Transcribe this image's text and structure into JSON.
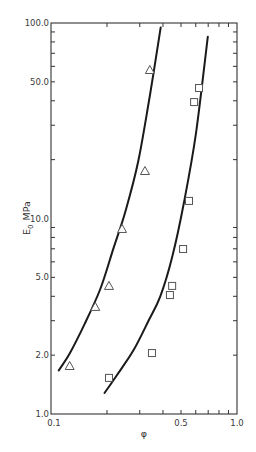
{
  "chart_data": {
    "type": "scatter",
    "title": "",
    "xlabel": "φ",
    "ylabel": "E0 MPa",
    "ylabel_main": "E",
    "ylabel_sub": "0",
    "ylabel_unit": "MPa",
    "xscale": "log",
    "yscale": "log",
    "xlim": [
      0.1,
      1.0
    ],
    "ylim": [
      1.0,
      100.0
    ],
    "grid": false,
    "legend": null,
    "x_tick_labels": [
      {
        "value": 0.1,
        "label": "0.1"
      },
      {
        "value": 0.5,
        "label": "0.5"
      },
      {
        "value": 1.0,
        "label": "1.0"
      }
    ],
    "x_minor_ticks": [
      0.2,
      0.3,
      0.4,
      0.5,
      0.6,
      0.7,
      0.8,
      0.9
    ],
    "y_tick_labels": [
      {
        "value": 1.0,
        "label": "1.0"
      },
      {
        "value": 2.0,
        "label": "2.0"
      },
      {
        "value": 5.0,
        "label": "5.0"
      },
      {
        "value": 10.0,
        "label": "10.0"
      },
      {
        "value": 50.0,
        "label": "50.0"
      },
      {
        "value": 100.0,
        "label": "100.0"
      }
    ],
    "y_minor_ticks": [
      2,
      3,
      4,
      5,
      6,
      7,
      8,
      9,
      20,
      30,
      40,
      50,
      60,
      70,
      80,
      90
    ],
    "series": [
      {
        "name": "triangles",
        "marker": "triangle-open",
        "points": [
          {
            "x": 0.126,
            "y": 1.76
          },
          {
            "x": 0.173,
            "y": 3.53
          },
          {
            "x": 0.205,
            "y": 4.52
          },
          {
            "x": 0.241,
            "y": 8.84
          },
          {
            "x": 0.32,
            "y": 17.5
          },
          {
            "x": 0.34,
            "y": 57.5
          }
        ],
        "fit_curve": [
          {
            "x": 0.11,
            "y": 1.67
          },
          {
            "x": 0.126,
            "y": 2.04
          },
          {
            "x": 0.152,
            "y": 2.9
          },
          {
            "x": 0.184,
            "y": 4.36
          },
          {
            "x": 0.216,
            "y": 6.97
          },
          {
            "x": 0.252,
            "y": 11.0
          },
          {
            "x": 0.295,
            "y": 19.8
          },
          {
            "x": 0.34,
            "y": 42.6
          },
          {
            "x": 0.389,
            "y": 95.0
          }
        ]
      },
      {
        "name": "squares",
        "marker": "square-open",
        "points": [
          {
            "x": 0.205,
            "y": 1.53
          },
          {
            "x": 0.349,
            "y": 2.05
          },
          {
            "x": 0.436,
            "y": 4.06
          },
          {
            "x": 0.448,
            "y": 4.52
          },
          {
            "x": 0.513,
            "y": 6.98
          },
          {
            "x": 0.552,
            "y": 12.3
          },
          {
            "x": 0.588,
            "y": 39.4
          },
          {
            "x": 0.625,
            "y": 46.5
          }
        ],
        "fit_curve": [
          {
            "x": 0.194,
            "y": 1.28
          },
          {
            "x": 0.225,
            "y": 1.57
          },
          {
            "x": 0.277,
            "y": 2.11
          },
          {
            "x": 0.334,
            "y": 2.99
          },
          {
            "x": 0.387,
            "y": 4.0
          },
          {
            "x": 0.449,
            "y": 6.39
          },
          {
            "x": 0.519,
            "y": 12.1
          },
          {
            "x": 0.601,
            "y": 27.1
          },
          {
            "x": 0.697,
            "y": 85.0
          }
        ]
      }
    ]
  },
  "plot_area": {
    "left": 51,
    "right": 237,
    "top": 23,
    "bottom": 414
  },
  "colors": {
    "ink": "#1a1a1a",
    "axis": "#333333",
    "marker": "#555555"
  }
}
